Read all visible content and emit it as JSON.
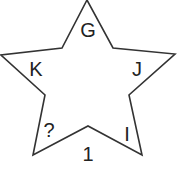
{
  "diagram": {
    "type": "star-puzzle",
    "stroke_color": "#333333",
    "text_color": "#222222",
    "labels": {
      "top": "G",
      "upper_left": "K",
      "upper_right": "J",
      "lower_left": "?",
      "lower_right": "I",
      "bottom": "1"
    }
  }
}
